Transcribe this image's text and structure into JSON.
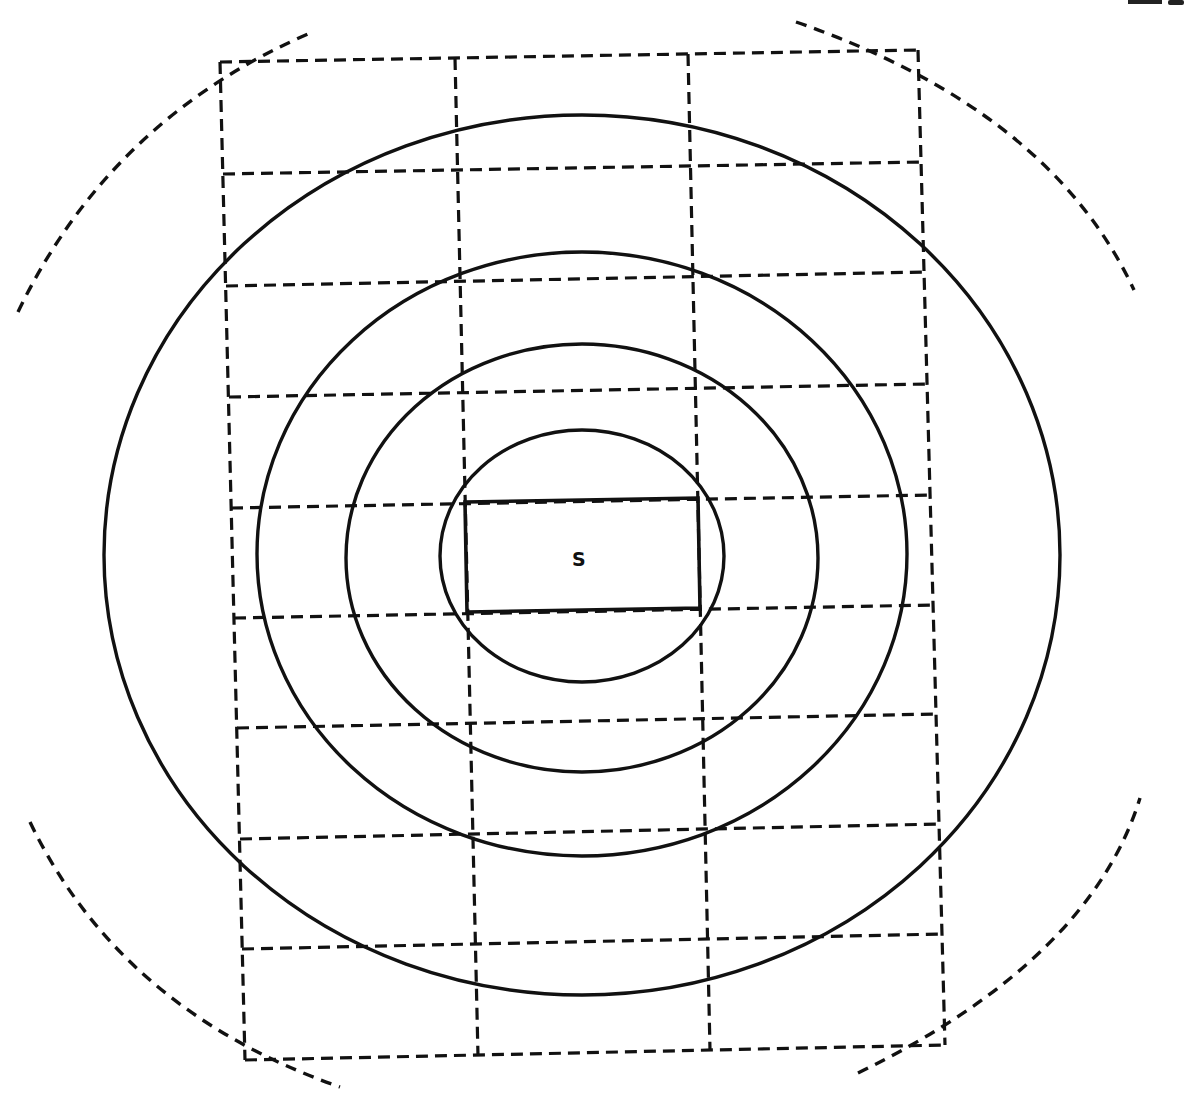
{
  "figure": {
    "type": "concentric contour diagram over dashed grid",
    "source_label": "S",
    "clipped_corner_label": "",
    "colors": {
      "ink": "#111111",
      "background": "#ffffff"
    }
  },
  "grid": {
    "columns": 3,
    "rows": 9,
    "line_style": "dashed",
    "corners": {
      "top_left": [
        220,
        62
      ],
      "top_right": [
        918,
        50
      ],
      "bottom_left": [
        245,
        1060
      ],
      "bottom_right": [
        945,
        1045
      ]
    }
  },
  "source": {
    "label": "S",
    "rect": {
      "x1": 465,
      "y1": 500,
      "x2": 700,
      "y2": 612
    }
  },
  "contours": [
    {
      "name": "contour-1",
      "cx": 582,
      "cy": 556,
      "rx": 142,
      "ry": 126
    },
    {
      "name": "contour-2",
      "cx": 582,
      "cy": 558,
      "rx": 236,
      "ry": 214
    },
    {
      "name": "contour-3",
      "cx": 582,
      "cy": 554,
      "rx": 325,
      "ry": 302
    },
    {
      "name": "contour-4",
      "cx": 582,
      "cy": 555,
      "rx": 478,
      "ry": 440
    }
  ],
  "outer_boundary": {
    "style": "dashed arcs",
    "segments": 4
  }
}
